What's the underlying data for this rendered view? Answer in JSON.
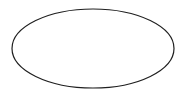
{
  "canvas": {
    "width": 186,
    "height": 98,
    "background_color": "#ffffff",
    "name": "ellipse-drawing"
  },
  "shape": {
    "kind": "ellipse",
    "label": "ellipse-outline",
    "center_x": 93,
    "center_y": 48.5,
    "radius_x": 81,
    "radius_y": 39.5,
    "stroke_color": "#1f1f1f",
    "stroke_width": 1.2,
    "fill": "none",
    "bounds": {
      "left": 12,
      "top": 9,
      "right": 174,
      "bottom": 88
    }
  }
}
